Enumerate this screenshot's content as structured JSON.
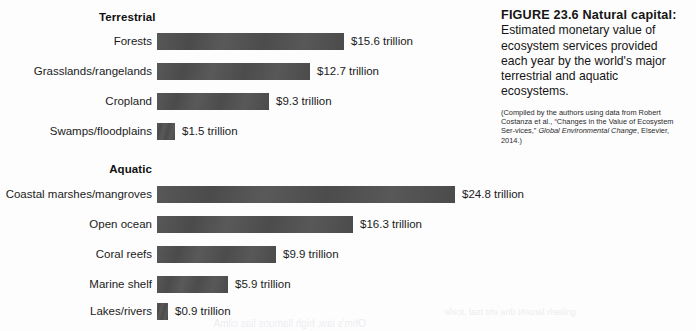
{
  "figure": {
    "caption_label": "FIGURE 23.6  Natural capital:",
    "caption_text": " Estimated monetary value of ecosystem services provided each year by the world's major terrestrial and aquatic ecosystems.",
    "source_prefix": "(Compiled by the authors using data from Robert Costanza et al., “Changes in the Value of Ecosystem Ser-vices,” ",
    "source_italic": "Global Environmental Change",
    "source_suffix": ", Elsevier, 2014.)"
  },
  "groups": {
    "terrestrial_label": "Terrestrial",
    "aquatic_label": "Aquatic"
  },
  "colors": {
    "bar": "#4f4f4f",
    "text": "#1b1b1b",
    "page": "#fdfdfd"
  },
  "bleed": {
    "line1": "gnilaeh larueN dna eht tsal ,tcefe",
    "line2": "Ohm's law, high llamuos lias cilmA"
  },
  "chart_data": {
    "type": "bar",
    "orientation": "horizontal",
    "title": "Natural capital: estimated monetary value of ecosystem services provided each year",
    "xlabel": "",
    "ylabel": "",
    "unit": "trillion US dollars per year",
    "xlim": [
      0,
      24.8
    ],
    "grid": false,
    "legend": false,
    "groups": [
      {
        "name": "Terrestrial",
        "categories": [
          "Forests",
          "Grasslands/rangelands",
          "Cropland",
          "Swamps/floodplains"
        ],
        "values": [
          15.6,
          12.7,
          9.3,
          1.5
        ],
        "labels": [
          "$15.6 trillion",
          "$12.7 trillion",
          "$9.3 trillion",
          "$1.5 trillion"
        ]
      },
      {
        "name": "Aquatic",
        "categories": [
          "Coastal marshes/mangroves",
          "Open ocean",
          "Coral reefs",
          "Marine shelf",
          "Lakes/rivers"
        ],
        "values": [
          24.8,
          16.3,
          9.9,
          5.9,
          0.9
        ],
        "labels": [
          "$24.8 trillion",
          "$16.3 trillion",
          "$9.9 trillion",
          "$5.9 trillion",
          "$0.9 trillion"
        ]
      }
    ]
  }
}
